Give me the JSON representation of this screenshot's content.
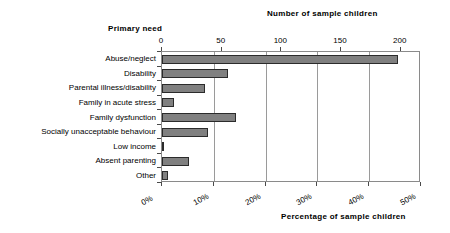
{
  "chart_data": {
    "type": "bar",
    "orientation": "horizontal",
    "title": "",
    "categories": [
      "Abuse/neglect",
      "Disability",
      "Parental illness/disability",
      "Family in acute stress",
      "Family dysfunction",
      "Socially unacceptable behaviour",
      "Low income",
      "Absent parenting",
      "Other"
    ],
    "values_percent": [
      45.6,
      12.8,
      8.3,
      2.3,
      14.2,
      8.8,
      0.3,
      5.3,
      1.2
    ],
    "values_count": [
      198,
      56,
      36,
      10,
      62,
      38,
      1,
      23,
      5
    ],
    "xlabel_top": "Number of sample children",
    "xlabel_bottom": "Percentage of sample children",
    "ylabel": "Primary need",
    "xlim_percent": [
      0,
      50
    ],
    "xlim_count": [
      0,
      217
    ],
    "top_ticks": [
      "0",
      "50",
      "100",
      "150",
      "200"
    ],
    "top_tick_values": [
      0,
      50,
      100,
      150,
      200
    ],
    "bottom_ticks": [
      "0%",
      "10%",
      "20%",
      "30%",
      "40%",
      "50%"
    ],
    "bottom_tick_values": [
      0,
      10,
      20,
      30,
      40,
      50
    ],
    "grid": true,
    "legend": "none",
    "bar_color": "#808080",
    "bar_border_color": "#2b2b2b",
    "axis_color": "#8a8a8a",
    "background": "#ffffff"
  },
  "titles": {
    "top_right": "Number of sample children",
    "top_left": "Primary need",
    "bottom": "Percentage of sample children"
  }
}
